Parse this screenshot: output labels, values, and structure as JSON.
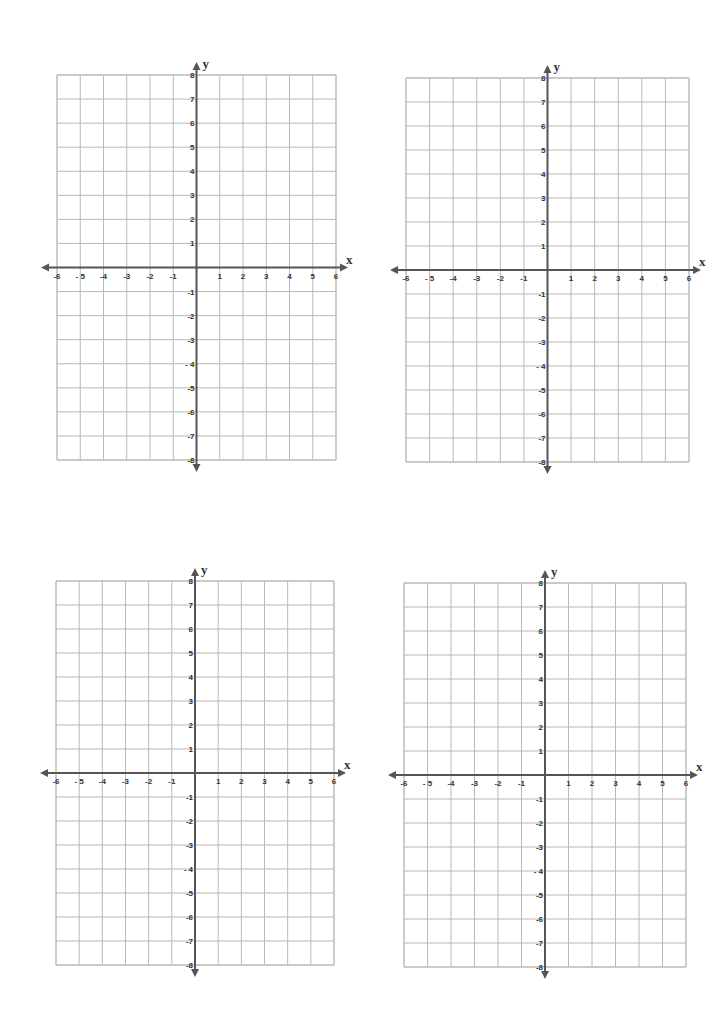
{
  "page": {
    "background": "#ffffff",
    "grid_line_color": "#b8b8b8",
    "axis_color": "#555555",
    "label_color": "#333333"
  },
  "planes": [
    {
      "id": "top-left",
      "left": 57,
      "top": 75,
      "width": 279,
      "height": 385,
      "origin_x": 197,
      "origin_y": 267
    },
    {
      "id": "top-right",
      "left": 406,
      "top": 78,
      "width": 283,
      "height": 384,
      "origin_x": 547,
      "origin_y": 270
    },
    {
      "id": "bottom-left",
      "left": 56,
      "top": 581,
      "width": 278,
      "height": 384,
      "origin_x": 196,
      "origin_y": 772
    },
    {
      "id": "bottom-right",
      "left": 404,
      "top": 583,
      "width": 282,
      "height": 384,
      "origin_x": 545,
      "origin_y": 775
    }
  ],
  "axes": {
    "x_label": "x",
    "y_label": "y",
    "x_range": [
      -6,
      6
    ],
    "y_range": [
      -8,
      8
    ],
    "x_tick_labels": [
      "-6",
      "- 5",
      "-4",
      "-3",
      "-2",
      "-1",
      "1",
      "2",
      "3",
      "4",
      "5",
      "6"
    ],
    "y_tick_labels": [
      "8",
      "7",
      "6",
      "5",
      "4",
      "3",
      "2",
      "1",
      "-1",
      "-2",
      "-3",
      "- 4",
      "-5",
      "-6",
      "-7",
      "-8"
    ]
  },
  "chart_data": [
    {
      "type": "coordinate-grid",
      "title": "",
      "xlabel": "x",
      "ylabel": "y",
      "xlim": [
        -6,
        6
      ],
      "ylim": [
        -8,
        8
      ],
      "grid": true,
      "series": []
    },
    {
      "type": "coordinate-grid",
      "title": "",
      "xlabel": "x",
      "ylabel": "y",
      "xlim": [
        -6,
        6
      ],
      "ylim": [
        -8,
        8
      ],
      "grid": true,
      "series": []
    },
    {
      "type": "coordinate-grid",
      "title": "",
      "xlabel": "x",
      "ylabel": "y",
      "xlim": [
        -6,
        6
      ],
      "ylim": [
        -8,
        8
      ],
      "grid": true,
      "series": []
    },
    {
      "type": "coordinate-grid",
      "title": "",
      "xlabel": "x",
      "ylabel": "y",
      "xlim": [
        -6,
        6
      ],
      "ylim": [
        -8,
        8
      ],
      "grid": true,
      "series": []
    }
  ]
}
